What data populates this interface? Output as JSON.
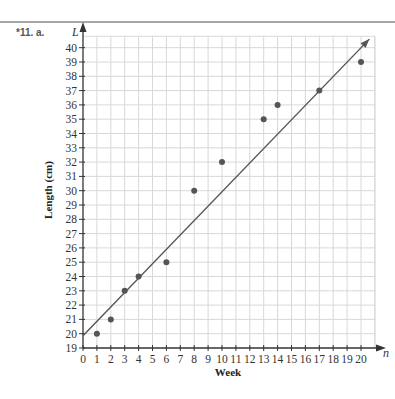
{
  "problem": {
    "label": "*11. a."
  },
  "chart_data": {
    "type": "scatter",
    "title": "",
    "xlabel": "Week",
    "ylabel": "Length (cm)",
    "x_axis_variable": "n",
    "y_axis_variable": "L",
    "xlim": [
      0,
      21
    ],
    "ylim": [
      19,
      40.8
    ],
    "grid": true,
    "x_ticks": [
      0,
      1,
      2,
      3,
      4,
      5,
      6,
      7,
      8,
      9,
      10,
      11,
      12,
      13,
      14,
      15,
      16,
      17,
      18,
      19,
      20
    ],
    "y_ticks": [
      19,
      20,
      21,
      22,
      23,
      24,
      25,
      26,
      27,
      28,
      29,
      30,
      31,
      32,
      33,
      34,
      35,
      36,
      37,
      38,
      39,
      40
    ],
    "series": [
      {
        "name": "data",
        "points": [
          {
            "x": 1,
            "y": 20
          },
          {
            "x": 2,
            "y": 21
          },
          {
            "x": 3,
            "y": 23
          },
          {
            "x": 4,
            "y": 24
          },
          {
            "x": 6,
            "y": 25
          },
          {
            "x": 8,
            "y": 30
          },
          {
            "x": 10,
            "y": 32
          },
          {
            "x": 13,
            "y": 35
          },
          {
            "x": 14,
            "y": 36
          },
          {
            "x": 17,
            "y": 37
          },
          {
            "x": 20,
            "y": 39
          }
        ]
      }
    ],
    "fit_line": {
      "type": "line-of-best-fit",
      "from": {
        "x": 0,
        "y": 19.85
      },
      "to": {
        "x": 20.6,
        "y": 40.6
      },
      "arrow_end": true
    },
    "colors": {
      "grid": "#d8d8d8",
      "axis": "#333333",
      "point": "#555555",
      "line": "#555555",
      "rule": "#888888"
    }
  }
}
